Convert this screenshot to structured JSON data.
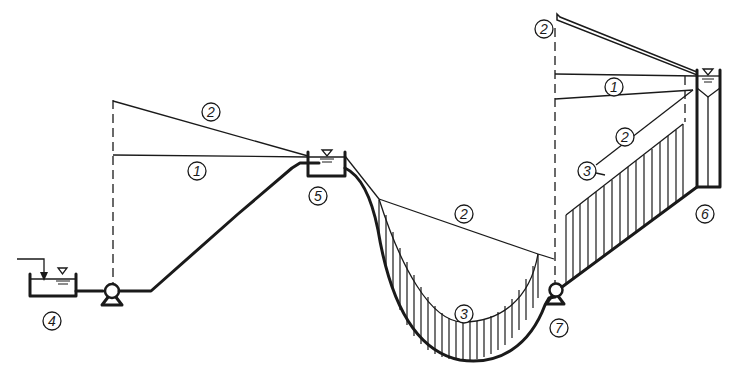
{
  "diagram": {
    "labels": {
      "static_head_1": "1",
      "pressure_line_2": "2",
      "pressure_region_3": "3",
      "suction_tank_4": "4",
      "intermediate_tank_5": "5",
      "upper_reservoir_6": "6",
      "booster_pump_7": "7"
    },
    "colors": {
      "ink": "#1a1a1a",
      "background": "#ffffff"
    }
  }
}
